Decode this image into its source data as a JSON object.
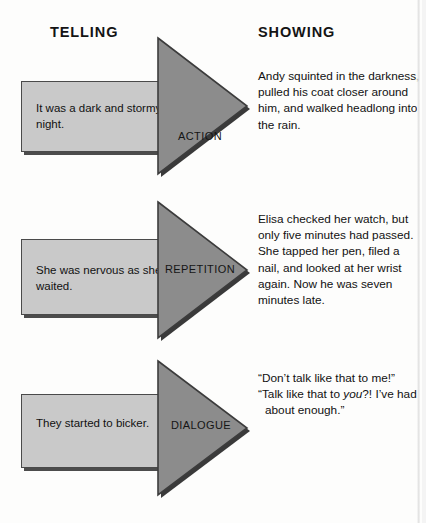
{
  "figure": {
    "type": "diagram",
    "columns": {
      "left_header": "TELLING",
      "right_header": "SHOWING"
    },
    "rows": [
      {
        "arrow_label": "ACTION",
        "telling": "It was a dark and stormy night.",
        "showing": "Andy squinted in the darkness, pulled his coat closer around him, and walked headlong into the rain."
      },
      {
        "arrow_label": "REPETITION",
        "telling": "She was nervous as she waited.",
        "showing": "Elisa checked her watch, but only five minutes had passed. She tapped her pen, filed a nail, and looked at her wrist again. Now he was seven minutes late."
      },
      {
        "arrow_label": "DIALOGUE",
        "telling": "They started to bicker.",
        "showing_lines": [
          "“Don’t talk like that to me!”",
          "“Talk like that to ",
          "you",
          "?! I’ve had about enough.”"
        ]
      }
    ],
    "colors": {
      "box_fill": "#c9c9c9",
      "box_border": "#4a4a4a",
      "box_shadow": "#4c4c4c",
      "arrow_fill": "#8c8c8c",
      "arrow_border": "#3c3c3c",
      "arrow_shadow": "#3a3a3a",
      "text": "#111111",
      "background": "#ffffff"
    }
  }
}
